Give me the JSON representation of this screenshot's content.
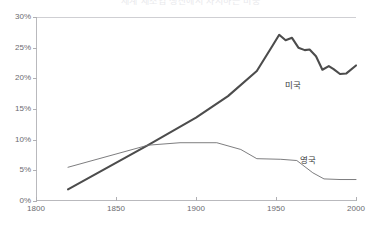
{
  "chart_data": {
    "type": "line",
    "title": "세계 제조업 생산에서 차지하는 비중",
    "xlabel": "",
    "ylabel": "",
    "xlim": [
      1800,
      2000
    ],
    "ylim": [
      0,
      30
    ],
    "x_ticks": [
      1800,
      1850,
      1900,
      1950,
      2000
    ],
    "x_tick_labels": [
      "1800",
      "1850",
      "1900",
      "1950",
      "2000"
    ],
    "y_ticks": [
      0,
      5,
      10,
      15,
      20,
      25,
      30
    ],
    "y_tick_labels": [
      "0%",
      "5%",
      "10%",
      "15%",
      "20%",
      "25%",
      "30%"
    ],
    "grid": false,
    "legend": "inline-labels",
    "series": [
      {
        "name": "미국",
        "style": "thick",
        "color": "#4c4c4c",
        "label_position": {
          "x": 1982,
          "y": 17.0
        },
        "points": [
          {
            "x": 1820,
            "y": 1.9
          },
          {
            "x": 1870,
            "y": 9.1
          },
          {
            "x": 1900,
            "y": 13.6
          },
          {
            "x": 1920,
            "y": 17.1
          },
          {
            "x": 1938,
            "y": 21.2
          },
          {
            "x": 1948,
            "y": 25.4
          },
          {
            "x": 1952,
            "y": 27.1
          },
          {
            "x": 1956,
            "y": 26.2
          },
          {
            "x": 1960,
            "y": 26.6
          },
          {
            "x": 1964,
            "y": 25.0
          },
          {
            "x": 1968,
            "y": 24.6
          },
          {
            "x": 1971,
            "y": 24.7
          },
          {
            "x": 1975,
            "y": 23.6
          },
          {
            "x": 1979,
            "y": 21.4
          },
          {
            "x": 1983,
            "y": 22.0
          },
          {
            "x": 1986,
            "y": 21.5
          },
          {
            "x": 1990,
            "y": 20.7
          },
          {
            "x": 1994,
            "y": 20.8
          },
          {
            "x": 2000,
            "y": 22.1
          }
        ]
      },
      {
        "name": "영국",
        "style": "thin",
        "color": "#6e6e70",
        "label_position": {
          "x": 1975,
          "y": 5.4
        },
        "points": [
          {
            "x": 1820,
            "y": 5.5
          },
          {
            "x": 1870,
            "y": 9.1
          },
          {
            "x": 1890,
            "y": 9.5
          },
          {
            "x": 1913,
            "y": 9.5
          },
          {
            "x": 1928,
            "y": 8.4
          },
          {
            "x": 1938,
            "y": 6.9
          },
          {
            "x": 1953,
            "y": 6.8
          },
          {
            "x": 1963,
            "y": 6.6
          },
          {
            "x": 1973,
            "y": 4.6
          },
          {
            "x": 1980,
            "y": 3.6
          },
          {
            "x": 1990,
            "y": 3.5
          },
          {
            "x": 2000,
            "y": 3.5
          }
        ]
      }
    ]
  }
}
